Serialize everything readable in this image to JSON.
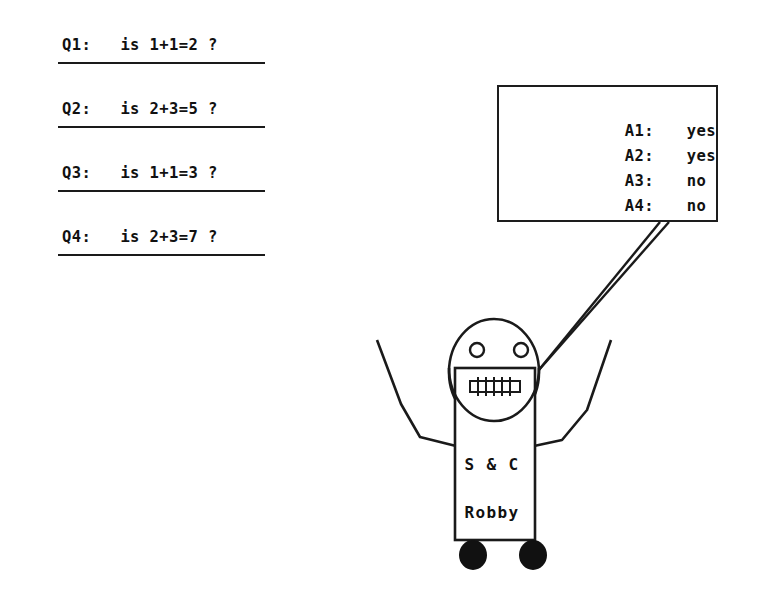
{
  "figure": {
    "background_color": "#ffffff",
    "ink_color": "#111111"
  },
  "questions": {
    "items": [
      {
        "label": "Q1:",
        "text": "Q1:   is 1+1=2 ?",
        "expression": "is 1+1=2 ?"
      },
      {
        "label": "Q2:",
        "text": "Q2:   is 2+3=5 ?",
        "expression": "is 2+3=5 ?"
      },
      {
        "label": "Q3:",
        "text": "Q3:   is 1+1=3 ?",
        "expression": "is 1+1=3 ?"
      },
      {
        "label": "Q4:",
        "text": "Q4:   is 2+3=7 ?",
        "expression": "is 2+3=7 ?"
      }
    ]
  },
  "answer_sign": {
    "items": [
      {
        "label": "A1:",
        "value": "yes"
      },
      {
        "label": "A2:",
        "value": "yes"
      },
      {
        "label": "A3:",
        "value": "no"
      },
      {
        "label": "A4:",
        "value": "no"
      }
    ]
  },
  "robot": {
    "brand": "S & C",
    "name": "Robby"
  }
}
